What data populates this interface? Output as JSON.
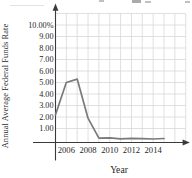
{
  "page": {
    "background": "#ffffff"
  },
  "chart_data": {
    "type": "line",
    "title": "",
    "xlabel": "Year",
    "ylabel": "Annual Average Federal Funds Rate",
    "x": [
      2005,
      2006,
      2007,
      2008,
      2009,
      2010,
      2011,
      2012,
      2013,
      2014,
      2015
    ],
    "values": [
      2.2,
      5.0,
      5.3,
      1.9,
      0.16,
      0.18,
      0.1,
      0.14,
      0.11,
      0.09,
      0.13
    ],
    "x_ticks": [
      2006,
      2008,
      2010,
      2012,
      2014
    ],
    "x_tick_labels": [
      "2006",
      "2008",
      "2010",
      "2012",
      "2014"
    ],
    "y_ticks": [
      10,
      9,
      8,
      7,
      6,
      5,
      4,
      3,
      2,
      1
    ],
    "y_tick_labels": [
      "10.00%",
      "9.00",
      "8.00",
      "7.00",
      "6.00",
      "5.00",
      "4.00",
      "3.00",
      "2.00",
      "1.00"
    ],
    "xlim": [
      2005,
      2017
    ],
    "ylim": [
      0,
      11
    ],
    "grid": true,
    "legend": "none",
    "colors": {
      "line": "#7a7a7a",
      "grid": "#d8d8d8",
      "axis": "#3a3a3a",
      "text": "#1f1f1f",
      "background": "#ffffff"
    }
  }
}
